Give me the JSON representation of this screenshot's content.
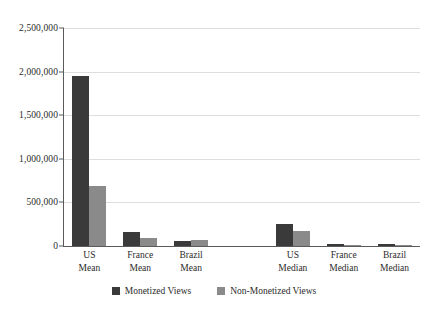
{
  "chart_data": {
    "type": "bar",
    "title": "",
    "subtitle": "",
    "xlabel": "",
    "ylabel": "",
    "ylim": [
      0,
      2500000
    ],
    "yticks": [
      0,
      500000,
      1000000,
      1500000,
      2000000,
      2500000
    ],
    "ytick_labels": [
      "0",
      "500,000",
      "1,000,000",
      "1,500,000",
      "2,000,000",
      "2,500,000"
    ],
    "grid": true,
    "legend_position": "bottom-center",
    "categories": [
      "US Mean",
      "France Mean",
      "Brazil Mean",
      "US Median",
      "France Median",
      "Brazil Median"
    ],
    "category_lines": [
      [
        "US",
        "Mean"
      ],
      [
        "France",
        "Mean"
      ],
      [
        "Brazil",
        "Mean"
      ],
      [
        "US",
        "Median"
      ],
      [
        "France",
        "Median"
      ],
      [
        "Brazil",
        "Median"
      ]
    ],
    "series": [
      {
        "name": "Monetized Views",
        "color": "#3a3a3a",
        "values": [
          1950000,
          165000,
          55000,
          250000,
          20000,
          22000
        ]
      },
      {
        "name": "Non-Monetized Views",
        "color": "#8a8a8a",
        "values": [
          690000,
          90000,
          70000,
          170000,
          15000,
          15000
        ]
      }
    ]
  },
  "legend": {
    "items": [
      {
        "label": "Monetized Views",
        "color": "#3a3a3a"
      },
      {
        "label": "Non-Monetized Views",
        "color": "#8a8a8a"
      }
    ]
  },
  "colors": {
    "monetized": "#3a3a3a",
    "non_monetized": "#8a8a8a",
    "gridline": "#dedede",
    "axis": "#5a5a5a",
    "text": "#2b2b2b",
    "background": "#ffffff"
  }
}
